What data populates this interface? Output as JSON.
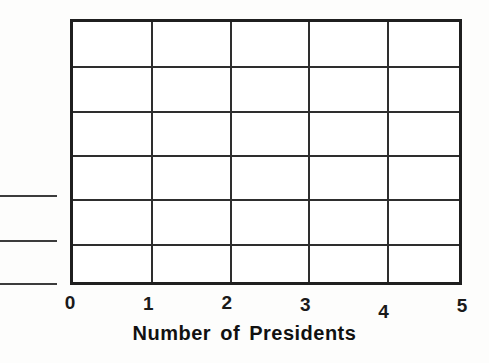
{
  "chart_data": {
    "type": "bar",
    "title": "",
    "xlabel": "Number of Presidents",
    "ylabel": "",
    "categories": [],
    "values": [],
    "series": [],
    "x_ticks": [
      "0",
      "1",
      "2",
      "3",
      "4",
      "5"
    ],
    "xlim": [
      0,
      5
    ],
    "grid": true,
    "grid_columns": 5,
    "grid_rows": 6,
    "legend": "none",
    "note": "Empty grid template; no bars plotted"
  },
  "axis": {
    "x_title": "Number of Presidents",
    "ticks": [
      {
        "label": "0",
        "value": 0
      },
      {
        "label": "1",
        "value": 1
      },
      {
        "label": "2",
        "value": 2
      },
      {
        "label": "3",
        "value": 3
      },
      {
        "label": "4",
        "value": 4
      },
      {
        "label": "5",
        "value": 5
      }
    ]
  },
  "colors": {
    "frame": "#1f1f1f",
    "grid": "#2e2e2e",
    "text": "#111111",
    "background": "#fdfdfc",
    "plot_background": "#ffffff"
  },
  "edge_artifacts": {
    "count": 3,
    "description": "cropped rule fragments at left margin"
  }
}
